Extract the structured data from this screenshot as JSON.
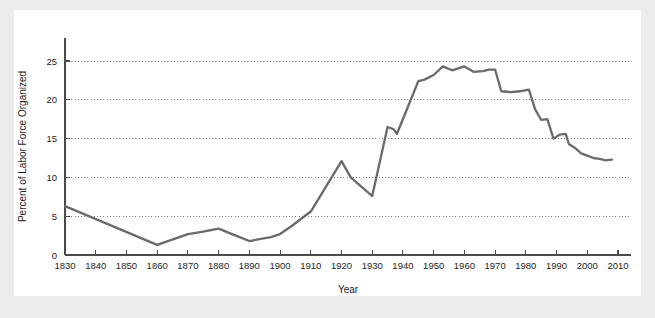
{
  "figure": {
    "background_color": "#ececec",
    "panel_color": "#ffffff",
    "line_color": "#6a6a6a",
    "axis_color": "#4a4a4a",
    "grid_color": "#6e6e6e"
  },
  "chart_data": {
    "type": "line",
    "title": "",
    "subtitle": "",
    "xlabel": "Year",
    "ylabel": "Percent of Labor Force Organized",
    "xlim": [
      1826,
      2014
    ],
    "ylim": [
      0,
      27.5
    ],
    "grid": "horizontal-dotted",
    "legend": "none",
    "xticks": [
      1830,
      1840,
      1850,
      1860,
      1870,
      1880,
      1890,
      1900,
      1910,
      1920,
      1930,
      1940,
      1950,
      1960,
      1970,
      1980,
      1990,
      2000,
      2010
    ],
    "xtick_labels": [
      "1830",
      "1840",
      "1850",
      "1860",
      "1870",
      "1880",
      "1890",
      "1900",
      "1910",
      "1920",
      "1930",
      "1940",
      "1950",
      "1960",
      "1970",
      "1980",
      "1990",
      "2000",
      "2010"
    ],
    "yticks": [
      0,
      5,
      10,
      15,
      20,
      25
    ],
    "ytick_labels": [
      "0",
      "5",
      "10",
      "15",
      "20",
      "25"
    ],
    "series": [
      {
        "name": "Percent of Labor Force Organized",
        "color": "#6a6a6a",
        "x": [
          1830,
          1860,
          1870,
          1875,
          1880,
          1885,
          1890,
          1897,
          1900,
          1904,
          1910,
          1920,
          1923,
          1930,
          1935,
          1937,
          1938,
          1941,
          1945,
          1947,
          1950,
          1953,
          1956,
          1960,
          1963,
          1966,
          1968,
          1970,
          1972,
          1975,
          1978,
          1981,
          1983,
          1985,
          1987,
          1989,
          1991,
          1993,
          1994,
          1996,
          1998,
          2000,
          2002,
          2004,
          2006,
          2008
        ],
        "y": [
          6.3,
          1.3,
          2.7,
          3.0,
          3.4,
          2.6,
          1.8,
          2.3,
          2.7,
          3.8,
          5.6,
          12.1,
          10.0,
          7.6,
          16.5,
          16.2,
          15.6,
          18.5,
          22.4,
          22.6,
          23.2,
          24.3,
          23.8,
          24.3,
          23.6,
          23.7,
          23.9,
          23.9,
          21.1,
          21.0,
          21.1,
          21.3,
          18.8,
          17.4,
          17.5,
          15.0,
          15.5,
          15.6,
          14.3,
          13.8,
          13.1,
          12.8,
          12.5,
          12.4,
          12.2,
          12.3
        ]
      }
    ]
  }
}
